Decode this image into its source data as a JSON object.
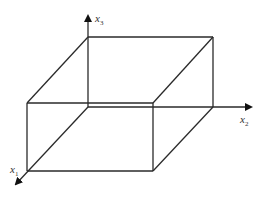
{
  "diagram": {
    "type": "3d-box-with-axes",
    "axes": [
      {
        "name": "x1",
        "base": "x",
        "sub": "1"
      },
      {
        "name": "x2",
        "base": "x",
        "sub": "2"
      },
      {
        "name": "x3",
        "base": "x",
        "sub": "3"
      }
    ],
    "colors": {
      "line": "#2a2a2a",
      "text": "#333333",
      "background": "#ffffff"
    }
  }
}
